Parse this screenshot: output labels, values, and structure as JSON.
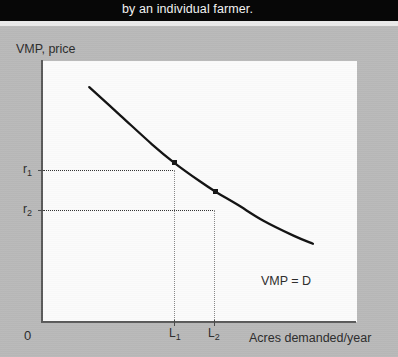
{
  "caption": {
    "text": "by an individual farmer."
  },
  "figure": {
    "y_axis_title": "VMP, price",
    "x_axis_title": "Acres demanded/year",
    "origin_label": "0",
    "curve_label": "VMP = D",
    "y_ticks": [
      {
        "id": "r1",
        "label": "r",
        "sub": "1"
      },
      {
        "id": "r2",
        "label": "r",
        "sub": "2"
      }
    ],
    "x_ticks": [
      {
        "id": "l1",
        "label": "L",
        "sub": "1"
      },
      {
        "id": "l2",
        "label": "L",
        "sub": "2"
      }
    ]
  },
  "colors": {
    "caption_band": "#070707",
    "page_background": "#b9b9b9",
    "plot_background": "#fbfbfb",
    "axis": "#5a5a5a",
    "curve": "#111111",
    "guide_dotted": "#2e2e2e",
    "marker": "#151515",
    "text": "#2b2b2b"
  },
  "chart_data": {
    "type": "line",
    "title": "",
    "subtitle": "by an individual farmer.",
    "xlabel": "Acres demanded/year",
    "ylabel": "VMP, price",
    "grid": false,
    "legend_position": "inline-right",
    "legend": [
      "VMP = D"
    ],
    "annotations": [
      "VMP = D",
      "r1 corresponds to L1",
      "r2 corresponds to L2"
    ],
    "axis_tick_labels": {
      "y": [
        "r₁",
        "r₂"
      ],
      "x": [
        "L₁",
        "L₂"
      ]
    },
    "xlim": [
      0,
      1
    ],
    "ylim": [
      0,
      1
    ],
    "series": [
      {
        "name": "VMP = D",
        "comment": "downward-sloping convex demand curve, normalized units",
        "x": [
          0.15,
          0.25,
          0.35,
          0.42,
          0.5,
          0.55,
          0.62,
          0.7,
          0.8,
          0.86
        ],
        "y": [
          0.9,
          0.79,
          0.68,
          0.61,
          0.54,
          0.5,
          0.45,
          0.39,
          0.33,
          0.3
        ]
      }
    ],
    "points": [
      {
        "label": "(L₁, r₁)",
        "x": 0.42,
        "y": 0.61
      },
      {
        "label": "(L₂, r₂)",
        "x": 0.55,
        "y": 0.5
      }
    ]
  }
}
